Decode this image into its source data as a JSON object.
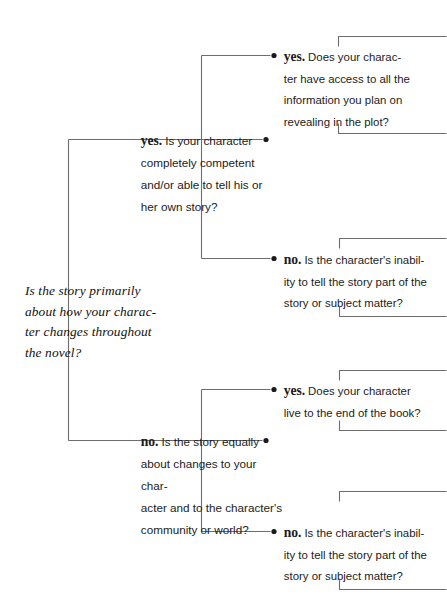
{
  "diagram": {
    "type": "decision-tree",
    "title_text": "Is the story primarily about how your charac-ter changes throughout the novel?",
    "root": {
      "id": "root-question",
      "text": "Is the story primarily about how your character changes throughout the novel?",
      "lines": [
        "Is the story primarily",
        "about how your charac-",
        "ter changes throughout",
        "the novel?"
      ]
    },
    "level1": [
      {
        "id": "yes-branch-1",
        "keyword": "yes.",
        "question": "Is your character completely competent and/or able to tell his or her own story?",
        "lines": [
          "Is your character",
          "completely competent",
          "and/or able to tell his or",
          "her own story?"
        ]
      },
      {
        "id": "no-branch-1",
        "keyword": "no.",
        "question": "Is the story equally about changes to your character and to the character's community or world?",
        "lines": [
          "Is the story equally",
          "about changes to your char-",
          "acter and to the character's",
          "community or world?"
        ]
      }
    ],
    "level2": [
      {
        "id": "yes-leaf-1",
        "parent": "yes-branch-1",
        "keyword": "yes.",
        "question": "Does your character have access to all the information you plan on revealing in the plot?",
        "lines": [
          "Does your charac-",
          "ter have access to all the",
          "information you plan on",
          "revealing in the plot?"
        ]
      },
      {
        "id": "no-leaf-1",
        "parent": "yes-branch-1",
        "keyword": "no.",
        "question": "Is the character's inability to tell the story part of the story or subject matter?",
        "lines": [
          "Is the character's inabil-",
          "ity to tell the story part of the",
          "story or subject matter?"
        ]
      },
      {
        "id": "yes-leaf-2",
        "parent": "no-branch-1",
        "keyword": "yes.",
        "question": "Does your character live to the end of the book?",
        "lines": [
          "Does your character",
          "live to the end of the book?"
        ]
      },
      {
        "id": "no-leaf-2",
        "parent": "no-branch-1",
        "keyword": "no.",
        "question": "Is the character's inability to tell the story part of the story or subject matter?",
        "lines": [
          "Is the character's inabil-",
          "ity to tell the story part of the",
          "story or subject matter?"
        ]
      }
    ],
    "colors": {
      "background": "#ffffff",
      "text": "#1a1a1a",
      "line": "#6d6d6d",
      "bullet": "#1a1a1a"
    }
  }
}
